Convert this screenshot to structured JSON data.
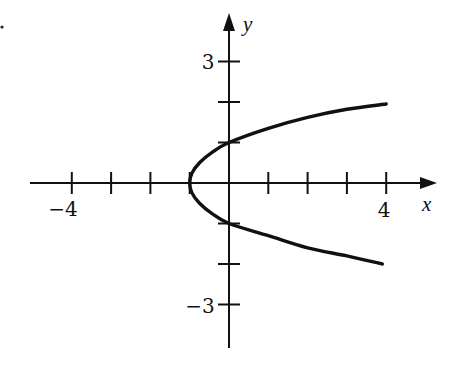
{
  "chart_data": {
    "type": "line",
    "title": "",
    "xlabel": "x",
    "ylabel": "y",
    "equation": "x = y^2 - 1",
    "xlim": [
      -5,
      5
    ],
    "ylim": [
      -4,
      4
    ],
    "grid": false,
    "x_ticks": [
      -4,
      -3,
      -2,
      -1,
      1,
      2,
      3,
      4
    ],
    "y_ticks": [
      -3,
      -2,
      -1,
      1,
      2,
      3
    ],
    "x_tick_labels": [
      {
        "value": -4,
        "label": "−4"
      },
      {
        "value": 4,
        "label": "4"
      }
    ],
    "y_tick_labels": [
      {
        "value": 3,
        "label": "3"
      },
      {
        "value": -3,
        "label": "−3"
      }
    ],
    "series": [
      {
        "name": "parabola",
        "color": "#111111",
        "points": [
          {
            "x": 3.9,
            "y": -2.0
          },
          {
            "x": 3.0,
            "y": -1.8
          },
          {
            "x": 2.0,
            "y": -1.6
          },
          {
            "x": 1.0,
            "y": -1.3
          },
          {
            "x": 0.0,
            "y": -1.0
          },
          {
            "x": -0.44,
            "y": -0.75
          },
          {
            "x": -0.75,
            "y": -0.5
          },
          {
            "x": -0.94,
            "y": -0.25
          },
          {
            "x": -1.0,
            "y": 0.0
          },
          {
            "x": -0.94,
            "y": 0.25
          },
          {
            "x": -0.75,
            "y": 0.5
          },
          {
            "x": -0.44,
            "y": 0.75
          },
          {
            "x": 0.0,
            "y": 1.0
          },
          {
            "x": 1.0,
            "y": 1.35
          },
          {
            "x": 2.0,
            "y": 1.62
          },
          {
            "x": 3.0,
            "y": 1.82
          },
          {
            "x": 4.0,
            "y": 1.95
          }
        ]
      }
    ],
    "annotations": [
      {
        "type": "vertex",
        "x": -1,
        "y": 0
      },
      {
        "type": "y-intercept",
        "x": 0,
        "y": 1
      },
      {
        "type": "y-intercept",
        "x": 0,
        "y": -1
      }
    ]
  },
  "labels": {
    "x_axis": "x",
    "y_axis": "y",
    "x_neg4": "−4",
    "x_pos4": "4",
    "y_pos3": "3",
    "y_neg3": "−3"
  }
}
